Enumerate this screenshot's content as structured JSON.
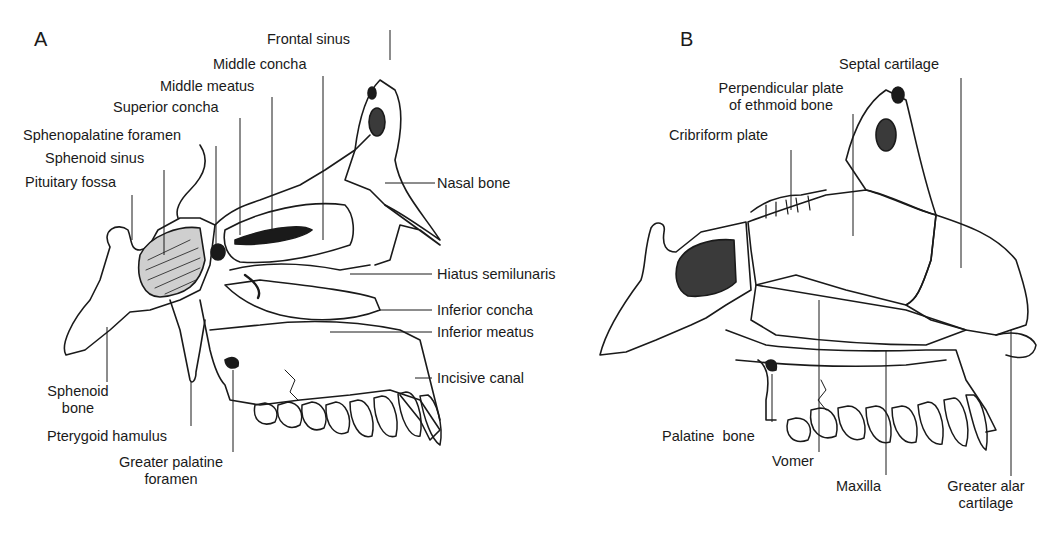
{
  "figure": {
    "panels": [
      {
        "letter": "A",
        "title": "Lateral wall of nasal cavity",
        "labels": {
          "frontal_sinus": "Frontal sinus",
          "middle_concha": "Middle concha",
          "middle_meatus": "Middle meatus",
          "superior_concha": "Superior concha",
          "sphenopalatine_foramen": "Sphenopalatine foramen",
          "sphenoid_sinus": "Sphenoid sinus",
          "pituitary_fossa": "Pituitary fossa",
          "nasal_bone": "Nasal bone",
          "hiatus_semilunaris": "Hiatus semilunaris",
          "inferior_concha": "Inferior concha",
          "inferior_meatus": "Inferior meatus",
          "incisive_canal": "Incisive canal",
          "sphenoid_bone_1": "Sphenoid",
          "sphenoid_bone_2": "bone",
          "pterygoid_hamulus": "Pterygoid hamulus",
          "greater_palatine_foramen_1": "Greater palatine",
          "greater_palatine_foramen_2": "foramen"
        }
      },
      {
        "letter": "B",
        "title": "Nasal septum",
        "labels": {
          "septal_cartilage": "Septal cartilage",
          "perpendicular_plate_1": "Perpendicular plate",
          "perpendicular_plate_2": "of ethmoid bone",
          "cribriform_plate": "Cribriform plate",
          "palatine_bone": "Palatine  bone",
          "vomer": "Vomer",
          "maxilla": "Maxilla",
          "greater_alar_cartilage_1": "Greater alar",
          "greater_alar_cartilage_2": "cartilage"
        }
      }
    ],
    "colors": {
      "ink": "#1a1a1a",
      "background": "#ffffff"
    }
  }
}
